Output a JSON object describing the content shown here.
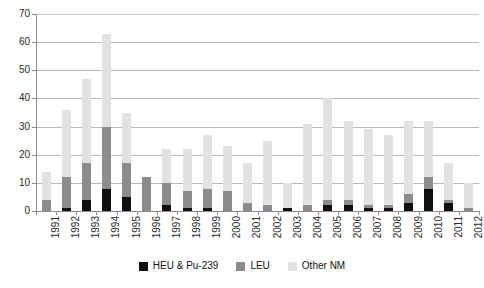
{
  "chart_data": {
    "type": "bar",
    "subtype": "stacked-bar",
    "title": "",
    "subtitle": "",
    "xlabel": "",
    "ylabel": "",
    "ylim": [
      0,
      70
    ],
    "ytick_step": 10,
    "yticks": [
      0,
      10,
      20,
      30,
      40,
      50,
      60,
      70
    ],
    "grid": true,
    "grid_axis": "y",
    "legend_position": "bottom-center",
    "categories": [
      "1991",
      "1992",
      "1993",
      "1994",
      "1995",
      "1996",
      "1997",
      "1998",
      "1999",
      "2000",
      "2001",
      "2002",
      "2003",
      "2004",
      "2005",
      "2006",
      "2007",
      "2008",
      "2009",
      "2010",
      "2011",
      "2012"
    ],
    "series": [
      {
        "name": "HEU & Pu-239",
        "color": "#101010",
        "values": [
          0,
          1,
          4,
          8,
          5,
          0,
          2,
          1,
          1,
          0,
          0,
          0,
          1,
          0,
          2,
          2,
          1,
          1,
          3,
          8,
          3,
          0
        ]
      },
      {
        "name": "LEU",
        "color": "#8c8c8c",
        "values": [
          4,
          11,
          13,
          22,
          12,
          12,
          8,
          6,
          7,
          7,
          3,
          2,
          0,
          2,
          2,
          2,
          1,
          1,
          3,
          4,
          1,
          1
        ]
      },
      {
        "name": "Other NM",
        "color": "#e2e2e2",
        "values": [
          10,
          24,
          30,
          33,
          18,
          0,
          12,
          15,
          19,
          16,
          14,
          23,
          9,
          29,
          36,
          28,
          27,
          25,
          26,
          20,
          13,
          9
        ]
      }
    ],
    "totals": [
      14,
      36,
      47,
      63,
      35,
      12,
      22,
      22,
      27,
      23,
      17,
      25,
      10,
      31,
      40,
      32,
      29,
      27,
      32,
      32,
      17,
      10
    ]
  },
  "legend": {
    "items": [
      {
        "label": "HEU & Pu-239",
        "color": "#101010",
        "swatch_name": "legend-swatch-heu-pu239"
      },
      {
        "label": "LEU",
        "color": "#8c8c8c",
        "swatch_name": "legend-swatch-leu"
      },
      {
        "label": "Other NM",
        "color": "#e2e2e2",
        "swatch_name": "legend-swatch-other-nm"
      }
    ]
  },
  "axes": {
    "y_tick_labels": [
      "70",
      "60",
      "50",
      "40",
      "30",
      "20",
      "10",
      "0"
    ],
    "x_tick_labels": [
      "1991",
      "1992",
      "1993",
      "1994",
      "1995",
      "1996",
      "1997",
      "1998",
      "1999",
      "2000",
      "2001",
      "2002",
      "2003",
      "2004",
      "2005",
      "2006",
      "2007",
      "2008",
      "2009",
      "2010",
      "2011",
      "2012"
    ]
  }
}
